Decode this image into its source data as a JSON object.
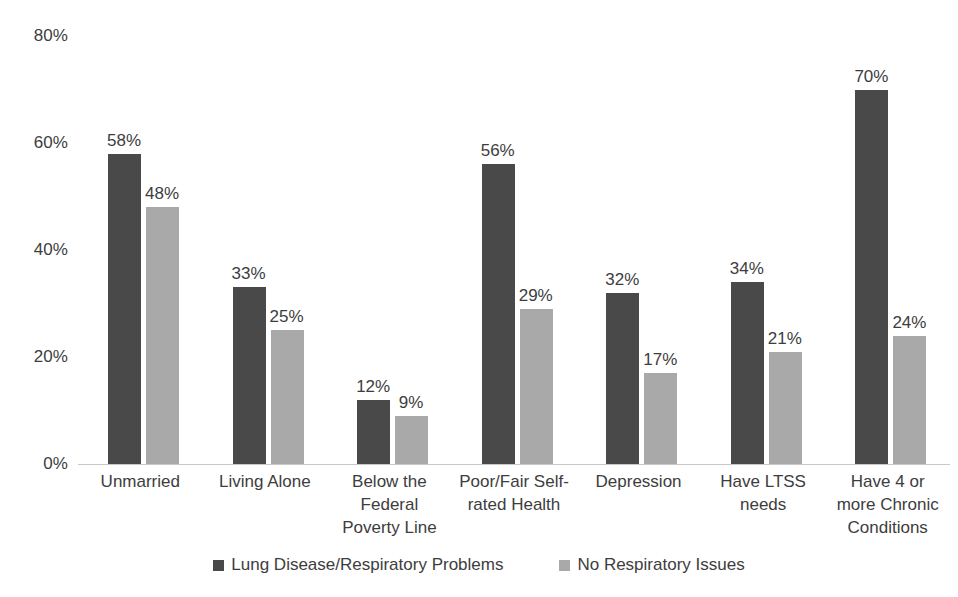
{
  "chart_data": {
    "type": "bar",
    "title": "",
    "subtitle": "",
    "xlabel": "",
    "ylabel": "",
    "ylim": [
      0,
      80
    ],
    "y_ticks": [
      "0%",
      "20%",
      "40%",
      "60%",
      "80%"
    ],
    "y_tick_values": [
      0,
      20,
      40,
      60,
      80
    ],
    "grid": false,
    "legend_position": "bottom",
    "categories": [
      "Unmarried",
      "Living Alone",
      "Below the Federal Poverty Line",
      "Poor/Fair Self-rated Health",
      "Depression",
      "Have LTSS needs",
      "Have 4 or more Chronic Conditions"
    ],
    "category_label_lines": [
      [
        "Unmarried"
      ],
      [
        "Living Alone"
      ],
      [
        "Below the",
        "Federal",
        "Poverty Line"
      ],
      [
        "Poor/Fair Self-",
        "rated Health"
      ],
      [
        "Depression"
      ],
      [
        "Have LTSS",
        "needs"
      ],
      [
        "Have 4 or",
        "more Chronic",
        "Conditions"
      ]
    ],
    "series": [
      {
        "name": "Lung Disease/Respiratory Problems",
        "color": "#494949",
        "values": [
          58,
          33,
          12,
          56,
          32,
          34,
          70
        ],
        "value_labels": [
          "58%",
          "33%",
          "12%",
          "56%",
          "32%",
          "34%",
          "70%"
        ]
      },
      {
        "name": "No Respiratory Issues",
        "color": "#a9a9a9",
        "values": [
          48,
          25,
          9,
          29,
          17,
          21,
          24
        ],
        "value_labels": [
          "48%",
          "25%",
          "9%",
          "29%",
          "17%",
          "21%",
          "24%"
        ]
      }
    ]
  },
  "legend": {
    "items": [
      {
        "label": "Lung Disease/Respiratory Problems",
        "swatch": "legend-swatch-primary"
      },
      {
        "label": "No Respiratory Issues",
        "swatch": "legend-swatch-secondary"
      }
    ]
  },
  "axis": {
    "baseline_color": "#c9c9c9",
    "tick_text_color": "#3d3d3d"
  }
}
